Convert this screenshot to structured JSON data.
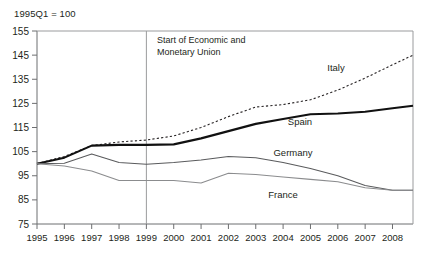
{
  "header": {
    "unit_note": "1995Q1 = 100"
  },
  "annotation": {
    "line1": "Start of Economic and",
    "line2": "Monetary Union",
    "at_year": 1999
  },
  "series_labels": {
    "italy": "Italy",
    "spain": "Spain",
    "germany": "Germany",
    "france": "France"
  },
  "chart_data": {
    "type": "line",
    "title": "",
    "subtitle": "",
    "xlabel": "",
    "ylabel": "",
    "unit_note": "1995Q1 = 100",
    "grid": false,
    "legend_position": "inline-labels",
    "xlim": [
      1995,
      2008.75
    ],
    "ylim": [
      75,
      155
    ],
    "yticks": [
      75,
      85,
      95,
      105,
      115,
      125,
      135,
      145,
      155
    ],
    "ytick_labels": [
      "75",
      "85",
      "95",
      "105",
      "115",
      "125",
      "135",
      "145",
      "155"
    ],
    "xticks": [
      1995,
      1996,
      1997,
      1998,
      1999,
      2000,
      2001,
      2002,
      2003,
      2004,
      2005,
      2006,
      2007,
      2008
    ],
    "xtick_labels": [
      "1995",
      "1996",
      "1997",
      "1998",
      "1999",
      "2000",
      "2001",
      "2002",
      "2003",
      "2004",
      "2005",
      "2006",
      "2007",
      "2008"
    ],
    "annotations": [
      {
        "text": "Start of Economic and Monetary Union",
        "x": 1999,
        "type": "vline"
      }
    ],
    "x": [
      1995,
      1996,
      1997,
      1998,
      1999,
      2000,
      2001,
      2002,
      2003,
      2004,
      2005,
      2006,
      2007,
      2008,
      2008.75
    ],
    "series": [
      {
        "name": "Italy",
        "style": "dotted",
        "color": "#231f20",
        "values": [
          100.0,
          103.0,
          107.5,
          109.0,
          109.8,
          111.5,
          115.0,
          119.5,
          123.5,
          124.5,
          126.5,
          130.5,
          135.5,
          141.0,
          145.0
        ]
      },
      {
        "name": "Spain",
        "style": "solid-thick",
        "color": "#111111",
        "values": [
          100.0,
          102.5,
          107.5,
          107.8,
          107.8,
          108.0,
          110.5,
          113.5,
          116.5,
          118.5,
          120.5,
          120.8,
          121.5,
          123.0,
          124.0
        ]
      },
      {
        "name": "Germany",
        "style": "solid-thin",
        "color": "#5a5b5d",
        "values": [
          100.0,
          100.2,
          104.0,
          100.5,
          99.8,
          100.5,
          101.5,
          103.0,
          102.5,
          100.5,
          98.0,
          95.0,
          91.0,
          89.0,
          89.0
        ]
      },
      {
        "name": "France",
        "style": "solid-thin",
        "color": "#8b8c8e",
        "values": [
          100.0,
          99.0,
          97.0,
          93.0,
          93.0,
          93.0,
          92.0,
          96.0,
          95.5,
          94.5,
          93.5,
          92.5,
          90.0,
          89.0,
          89.0
        ]
      }
    ]
  }
}
